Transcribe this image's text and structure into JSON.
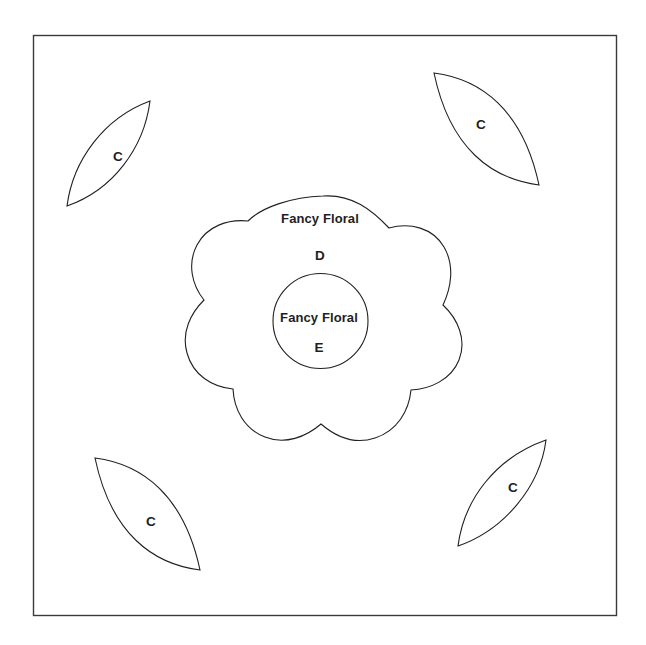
{
  "figure": {
    "background_color": "#ffffff",
    "stroke_color": "#231f20",
    "frame_color": "#3a3a3c"
  },
  "frame": {
    "name": "outer-frame"
  },
  "center_flower": {
    "brand_label": "Fancy Floral",
    "piece_letter": "D",
    "shape": "scalloped-flower"
  },
  "center_circle": {
    "brand_label": "Fancy Floral",
    "piece_letter": "E",
    "shape": "circle"
  },
  "leaves": [
    {
      "id": "top-left",
      "letter": "C",
      "shape": "leaf"
    },
    {
      "id": "top-right",
      "letter": "C",
      "shape": "leaf"
    },
    {
      "id": "bottom-left",
      "letter": "C",
      "shape": "leaf"
    },
    {
      "id": "bottom-right",
      "letter": "C",
      "shape": "leaf"
    }
  ]
}
